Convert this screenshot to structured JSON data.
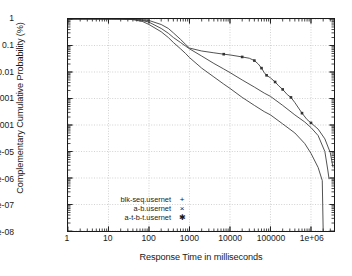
{
  "chart_data": {
    "type": "line",
    "title": "",
    "xlabel": "Response Time in milliseconds",
    "ylabel": "Complementary Cumulative Probability (%)",
    "xscale": "log",
    "yscale": "log",
    "xlim": [
      1,
      3700000
    ],
    "ylim": [
      1e-08,
      1
    ],
    "grid": true,
    "legend_position": "bottom-left",
    "xticks": [
      "1",
      "10",
      "100",
      "1000",
      "10000",
      "100000",
      "1e+06"
    ],
    "xtick_values": [
      1,
      10,
      100,
      1000,
      10000,
      100000,
      1000000
    ],
    "yticks": [
      "1",
      "0.1",
      "0.01",
      "0.001",
      "0.0001",
      "1e-05",
      "1e-06",
      "1e-07",
      "1e-08"
    ],
    "ytick_values": [
      1,
      0.1,
      0.01,
      0.001,
      0.0001,
      1e-05,
      1e-06,
      1e-07,
      1e-08
    ],
    "series": [
      {
        "name": "blk-seq.usernet",
        "marker": "+",
        "points": [
          [
            1,
            1
          ],
          [
            10,
            1
          ],
          [
            20,
            0.99
          ],
          [
            40,
            0.95
          ],
          [
            70,
            0.8
          ],
          [
            100,
            0.62
          ],
          [
            200,
            0.33
          ],
          [
            300,
            0.2
          ],
          [
            400,
            0.13
          ],
          [
            600,
            0.075
          ],
          [
            800,
            0.05
          ],
          [
            1000,
            0.035
          ],
          [
            2000,
            0.014
          ],
          [
            4000,
            0.0065
          ],
          [
            7000,
            0.0035
          ],
          [
            10000,
            0.0024
          ],
          [
            20000,
            0.0011
          ],
          [
            40000,
            0.00055
          ],
          [
            70000,
            0.00032
          ],
          [
            100000,
            0.00024
          ],
          [
            200000,
            0.00011
          ],
          [
            400000,
            5e-05
          ],
          [
            700000,
            2e-05
          ],
          [
            1000000,
            8.5e-06
          ],
          [
            1500000,
            2.5e-06
          ],
          [
            1900000,
            8e-07
          ],
          [
            2000000,
            1e-08
          ]
        ]
      },
      {
        "name": "a-b.usernet",
        "marker": "×",
        "points": [
          [
            1,
            1
          ],
          [
            10,
            1
          ],
          [
            20,
            0.995
          ],
          [
            40,
            0.97
          ],
          [
            70,
            0.88
          ],
          [
            100,
            0.76
          ],
          [
            200,
            0.44
          ],
          [
            300,
            0.29
          ],
          [
            400,
            0.2
          ],
          [
            600,
            0.13
          ],
          [
            800,
            0.095
          ],
          [
            1000,
            0.075
          ],
          [
            2000,
            0.04
          ],
          [
            4000,
            0.021
          ],
          [
            7000,
            0.013
          ],
          [
            10000,
            0.0095
          ],
          [
            20000,
            0.005
          ],
          [
            40000,
            0.0027
          ],
          [
            70000,
            0.0016
          ],
          [
            100000,
            0.0012
          ],
          [
            200000,
            0.00055
          ],
          [
            400000,
            0.00024
          ],
          [
            700000,
            0.00013
          ],
          [
            1000000,
            8e-05
          ],
          [
            1500000,
            4e-05
          ],
          [
            2200000,
            1e-05
          ],
          [
            2600000,
            2e-06
          ],
          [
            2800000,
            9e-07
          ]
        ]
      },
      {
        "name": "a-t-b-t.usernet",
        "marker": "✱",
        "points": [
          [
            1,
            1
          ],
          [
            10,
            1
          ],
          [
            20,
            0.998
          ],
          [
            40,
            0.985
          ],
          [
            70,
            0.94
          ],
          [
            100,
            0.88
          ],
          [
            200,
            0.62
          ],
          [
            300,
            0.44
          ],
          [
            400,
            0.3
          ],
          [
            600,
            0.17
          ],
          [
            800,
            0.11
          ],
          [
            1000,
            0.08
          ],
          [
            2000,
            0.062
          ],
          [
            4000,
            0.053
          ],
          [
            7000,
            0.047
          ],
          [
            10000,
            0.044
          ],
          [
            20000,
            0.037
          ],
          [
            30000,
            0.033
          ],
          [
            40000,
            0.027
          ],
          [
            50000,
            0.02
          ],
          [
            60000,
            0.014
          ],
          [
            70000,
            0.0095
          ],
          [
            80000,
            0.0075
          ],
          [
            100000,
            0.006
          ],
          [
            130000,
            0.0042
          ],
          [
            160000,
            0.003
          ],
          [
            200000,
            0.0022
          ],
          [
            260000,
            0.0014
          ],
          [
            320000,
            0.0011
          ],
          [
            400000,
            0.0007
          ],
          [
            600000,
            0.00028
          ],
          [
            800000,
            0.00016
          ],
          [
            1000000,
            0.00012
          ],
          [
            1500000,
            7e-05
          ],
          [
            2200000,
            3e-05
          ],
          [
            3000000,
            9e-06
          ],
          [
            3500000,
            2.5e-06
          ]
        ]
      }
    ]
  },
  "legend": {
    "entries": [
      {
        "label": "blk-seq.usernet",
        "symbol": "+"
      },
      {
        "label": "a-b.usernet",
        "symbol": "×"
      },
      {
        "label": "a-t-b-t.usernet",
        "symbol": "✱"
      }
    ]
  },
  "colors": {
    "axis": "#1a1a1a",
    "grid": "#b4b4b4",
    "curve": "#333333",
    "background": "#ffffff"
  }
}
